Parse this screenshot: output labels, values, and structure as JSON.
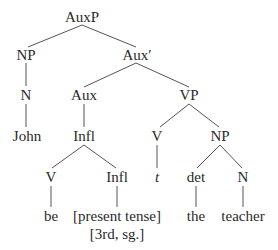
{
  "tree": {
    "nodes": [
      {
        "id": "auxp",
        "label": "AuxP",
        "x": 82,
        "y": 17
      },
      {
        "id": "np1",
        "label": "NP",
        "x": 26,
        "y": 55
      },
      {
        "id": "auxbar",
        "label": "Aux′",
        "x": 137,
        "y": 55
      },
      {
        "id": "n1",
        "label": "N",
        "x": 26,
        "y": 95
      },
      {
        "id": "aux",
        "label": "Aux",
        "x": 84,
        "y": 95
      },
      {
        "id": "vp",
        "label": "VP",
        "x": 189,
        "y": 95
      },
      {
        "id": "john",
        "label": "John",
        "x": 27,
        "y": 136
      },
      {
        "id": "infl1",
        "label": "Infl",
        "x": 84,
        "y": 136
      },
      {
        "id": "v1",
        "label": "V",
        "x": 157,
        "y": 136
      },
      {
        "id": "np2",
        "label": "NP",
        "x": 220,
        "y": 136
      },
      {
        "id": "v2",
        "label": "V",
        "x": 51,
        "y": 177
      },
      {
        "id": "infl2",
        "label": "Infl",
        "x": 117,
        "y": 177
      },
      {
        "id": "trace",
        "label": "t",
        "x": 157,
        "y": 177
      },
      {
        "id": "det",
        "label": "det",
        "x": 196,
        "y": 177
      },
      {
        "id": "n2",
        "label": "N",
        "x": 243,
        "y": 177
      },
      {
        "id": "be",
        "label": "be",
        "x": 51,
        "y": 216
      },
      {
        "id": "present",
        "label": "[present tense]",
        "x": 117,
        "y": 216
      },
      {
        "id": "thirdsg",
        "label": "[3rd, sg.]",
        "x": 117,
        "y": 234
      },
      {
        "id": "the",
        "label": "the",
        "x": 196,
        "y": 216
      },
      {
        "id": "teacher",
        "label": "teacher",
        "x": 243,
        "y": 216
      }
    ],
    "edges": [
      [
        82,
        25,
        28,
        47
      ],
      [
        82,
        25,
        136,
        47
      ],
      [
        26,
        63,
        26,
        86
      ],
      [
        136,
        63,
        84,
        87
      ],
      [
        136,
        63,
        189,
        87
      ],
      [
        26,
        104,
        26,
        127
      ],
      [
        84,
        104,
        84,
        127
      ],
      [
        189,
        104,
        160,
        127
      ],
      [
        189,
        104,
        219,
        127
      ],
      [
        84,
        145,
        52,
        168
      ],
      [
        84,
        145,
        116,
        168
      ],
      [
        157,
        145,
        157,
        168
      ],
      [
        220,
        145,
        197,
        168
      ],
      [
        220,
        145,
        242,
        168
      ],
      [
        51,
        186,
        51,
        207
      ],
      [
        117,
        186,
        117,
        207
      ],
      [
        196,
        186,
        196,
        207
      ],
      [
        243,
        186,
        243,
        207
      ]
    ]
  }
}
